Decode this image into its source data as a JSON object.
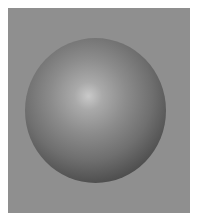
{
  "scene": {
    "subject": "shaded-sphere",
    "background_color": "#8f8f8f",
    "border_color": "#ffffff",
    "sphere": {
      "highlight_color": "#c9c9c9",
      "mid_color": "#7a7a7a",
      "shadow_color": "#1a1a1a"
    }
  }
}
